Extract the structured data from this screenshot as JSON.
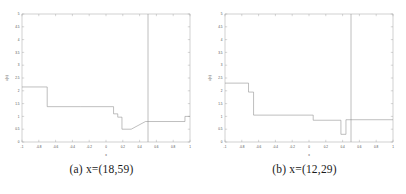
{
  "figure": {
    "panel_count": 2,
    "background": "#ffffff",
    "line_color": "#8a8a8a",
    "axis_color": "#9a9a9a",
    "text_color": "#4a4a4a"
  },
  "panels": [
    {
      "caption_label": "(a)",
      "caption_text": "x=(18,59)",
      "caption_full": "(a)  x=(18,59)"
    },
    {
      "caption_label": "(b)",
      "caption_text": "x=(12,29)",
      "caption_full": "(b)  x=(12,29)"
    }
  ],
  "chart_data": [
    {
      "type": "line",
      "title": "",
      "subtitle": "",
      "xlabel": "x",
      "ylabel": "u(x)",
      "xlim": [
        -1,
        1
      ],
      "ylim": [
        0,
        5
      ],
      "xticks": [
        -1,
        -0.8,
        -0.6,
        -0.4,
        -0.2,
        0,
        0.2,
        0.4,
        0.6,
        0.8,
        1
      ],
      "xticklabels": [
        "-1",
        "-0.8",
        "-0.6",
        "-0.4",
        "-0.2",
        "0",
        "0.2",
        "0.4",
        "0.6",
        "0.8",
        "1"
      ],
      "yticks": [
        0,
        0.5,
        1,
        1.5,
        2,
        2.5,
        3,
        3.5,
        4,
        4.5,
        5
      ],
      "yticklabels": [
        "0",
        "0.5",
        "1",
        "1.5",
        "2",
        "2.5",
        "3",
        "3.5",
        "4",
        "4.5",
        "5"
      ],
      "grid": false,
      "legend": "none",
      "series": [
        {
          "name": "step-profile",
          "style": "step",
          "color": "#8a8a8a",
          "x": [
            -1.0,
            -0.7,
            -0.7,
            -0.3,
            -0.3,
            0.09,
            0.09,
            0.14,
            0.14,
            0.19,
            0.19,
            0.3,
            0.3,
            0.47,
            0.47,
            0.94,
            0.94,
            1.0
          ],
          "y": [
            2.15,
            2.15,
            1.38,
            1.38,
            1.38,
            1.38,
            1.1,
            1.1,
            0.97,
            0.97,
            0.5,
            0.5,
            0.5,
            0.8,
            0.8,
            0.8,
            1.0,
            1.0
          ]
        }
      ],
      "annotations": [
        {
          "type": "vline",
          "name": "interface-line",
          "x": 0.5,
          "y_from": 0,
          "y_to": 5,
          "color": "#8a8a8a"
        }
      ]
    },
    {
      "type": "line",
      "title": "",
      "subtitle": "",
      "xlabel": "x",
      "ylabel": "u(x)",
      "xlim": [
        -1,
        1
      ],
      "ylim": [
        0,
        5
      ],
      "xticks": [
        -1,
        -0.8,
        -0.6,
        -0.4,
        -0.2,
        0,
        0.2,
        0.4,
        0.6,
        0.8,
        1
      ],
      "xticklabels": [
        "-1",
        "-0.8",
        "-0.6",
        "-0.4",
        "-0.2",
        "0",
        "0.2",
        "0.4",
        "0.6",
        "0.8",
        "1"
      ],
      "yticks": [
        0,
        0.5,
        1,
        1.5,
        2,
        2.5,
        3,
        3.5,
        4,
        4.5,
        5
      ],
      "yticklabels": [
        "0",
        "0.5",
        "1",
        "1.5",
        "2",
        "2.5",
        "3",
        "3.5",
        "4",
        "4.5",
        "5"
      ],
      "grid": false,
      "legend": "none",
      "series": [
        {
          "name": "step-profile",
          "style": "step",
          "color": "#8a8a8a",
          "x": [
            -1.0,
            -0.72,
            -0.72,
            -0.66,
            -0.66,
            -0.62,
            -0.62,
            0.05,
            0.05,
            0.38,
            0.38,
            0.44,
            0.44,
            1.0
          ],
          "y": [
            2.3,
            2.3,
            1.95,
            1.95,
            1.05,
            1.05,
            1.05,
            1.05,
            0.85,
            0.85,
            0.3,
            0.3,
            0.87,
            0.87
          ]
        }
      ],
      "annotations": [
        {
          "type": "vline",
          "name": "interface-line",
          "x": 0.5,
          "y_from": 0,
          "y_to": 5,
          "color": "#8a8a8a"
        }
      ]
    }
  ]
}
